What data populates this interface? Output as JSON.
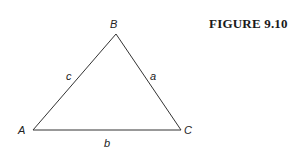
{
  "caption": "FIGURE 9.10",
  "vertices": [
    {
      "name": "A",
      "x": 33,
      "y": 130
    },
    {
      "name": "B",
      "x": 116,
      "y": 34
    },
    {
      "name": "C",
      "x": 181,
      "y": 130
    }
  ],
  "labels": {
    "vertex_A": "A",
    "vertex_B": "B",
    "vertex_C": "C",
    "side_a": "a",
    "side_b": "b",
    "side_c": "c"
  },
  "colors": {
    "stroke": "#333333",
    "text": "#222222"
  }
}
